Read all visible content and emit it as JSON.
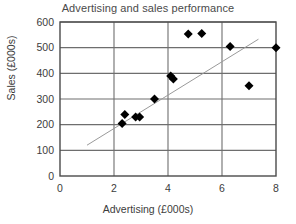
{
  "chart_data": {
    "type": "scatter",
    "title": "Advertising and sales performance",
    "xlabel": "Advertising (£000s)",
    "ylabel": "Sales (£000s)",
    "xlim": [
      0,
      8
    ],
    "ylim": [
      0,
      600
    ],
    "xticks": [
      0,
      2,
      4,
      6,
      8
    ],
    "yticks": [
      0,
      100,
      200,
      300,
      400,
      500,
      600
    ],
    "xtick_labels": [
      "0",
      "2",
      "4",
      "6",
      "8"
    ],
    "ytick_labels": [
      "0",
      "100",
      "200",
      "300",
      "400",
      "500",
      "600"
    ],
    "grid": true,
    "grid_x_every": 2,
    "grid_y_every": 100,
    "legend": null,
    "marker": "diamond",
    "marker_color": "#000000",
    "marker_size": 9,
    "series": [
      {
        "name": "Advertising vs Sales",
        "points": [
          {
            "x": 2.3,
            "y": 205
          },
          {
            "x": 2.4,
            "y": 240
          },
          {
            "x": 2.8,
            "y": 230
          },
          {
            "x": 2.95,
            "y": 230
          },
          {
            "x": 3.5,
            "y": 300
          },
          {
            "x": 4.1,
            "y": 390
          },
          {
            "x": 4.2,
            "y": 378
          },
          {
            "x": 4.75,
            "y": 553
          },
          {
            "x": 5.25,
            "y": 555
          },
          {
            "x": 6.3,
            "y": 505
          },
          {
            "x": 7.0,
            "y": 352
          },
          {
            "x": 8.0,
            "y": 500
          }
        ]
      }
    ],
    "trendline": {
      "name": "line of best fit",
      "x0": 1.0,
      "y0": 120,
      "x1": 7.35,
      "y1": 533,
      "color": "#9a9a9a",
      "width": 1
    },
    "colors": {
      "axis": "#4a4a4a",
      "grid": "#6e6e6e",
      "marker": "#000000",
      "trendline": "#9a9a9a",
      "title_text": "#4a4a4a",
      "label_text": "#3c3c3c",
      "background": "#ffffff"
    }
  }
}
